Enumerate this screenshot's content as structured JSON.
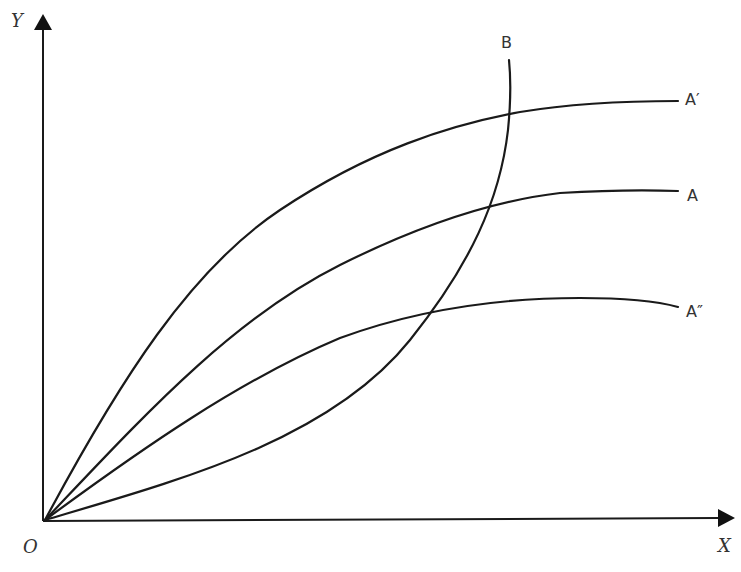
{
  "diagram": {
    "axes": {
      "y_label": "Y",
      "x_label": "X",
      "origin_label": "O"
    },
    "curves": [
      {
        "id": "A-prime",
        "label": "A′"
      },
      {
        "id": "A",
        "label": "A"
      },
      {
        "id": "A-double-prime",
        "label": "A″"
      },
      {
        "id": "B",
        "label": "B"
      }
    ],
    "colors": {
      "stroke": "#1a1a1a",
      "label": "#333333",
      "background": "#ffffff"
    }
  }
}
